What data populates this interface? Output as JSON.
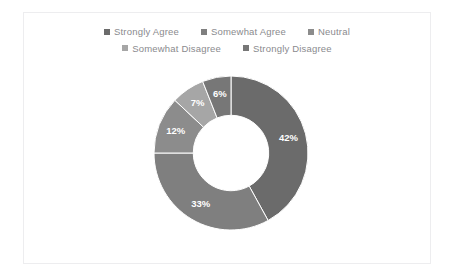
{
  "frame": {
    "border_color": "#ededef",
    "background": "#ffffff"
  },
  "legend": {
    "rows": [
      [
        {
          "label": "Strongly Agree",
          "color": "#6b6b6b"
        },
        {
          "label": "Somewhat Agree",
          "color": "#7f7f7f"
        },
        {
          "label": "Neutral",
          "color": "#8c8c8c"
        }
      ],
      [
        {
          "label": "Somewhat Disagree",
          "color": "#a6a6a6"
        },
        {
          "label": "Strongly Disagree",
          "color": "#777777"
        }
      ]
    ]
  },
  "chart_data": {
    "type": "pie",
    "variant": "donut",
    "title": "",
    "xlabel": "",
    "ylabel": "",
    "legend_position": "top",
    "hole_ratio": 0.49,
    "start_angle_deg": 0,
    "direction": "clockwise",
    "categories": [
      "Strongly Agree",
      "Somewhat Agree",
      "Neutral",
      "Somewhat Disagree",
      "Strongly Disagree"
    ],
    "values": [
      42,
      33,
      12,
      7,
      6
    ],
    "value_labels": [
      "42%",
      "33%",
      "12%",
      "7%",
      "6%"
    ],
    "colors": [
      "#6b6b6b",
      "#7f7f7f",
      "#8c8c8c",
      "#a6a6a6",
      "#777777"
    ],
    "label_color": "#ffffff",
    "units": "percent"
  }
}
